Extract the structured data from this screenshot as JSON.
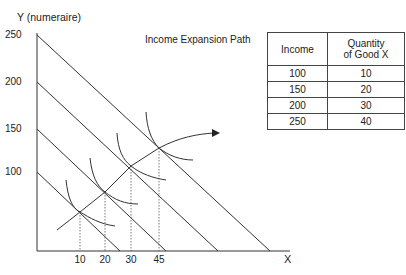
{
  "diagram": {
    "title": "Income Expansion Path",
    "y_axis_label": "Y (numeraire)",
    "x_axis_label": "X",
    "y_ticks": [
      "250",
      "200",
      "150",
      "100"
    ],
    "x_ticks": [
      "10",
      "20",
      "30",
      "45"
    ],
    "budget_lines": [
      {
        "income": 100,
        "y_intercept": 100
      },
      {
        "income": 150,
        "y_intercept": 150
      },
      {
        "income": 200,
        "y_intercept": 200
      },
      {
        "income": 250,
        "y_intercept": 250
      }
    ],
    "tangency_points_x": [
      10,
      20,
      30,
      45
    ],
    "expansion_path_arrow": "arrow-right",
    "line_color": "#333333"
  },
  "table": {
    "headers": [
      "Income",
      "Quantity\nof Good X"
    ],
    "header_line1": "Quantity",
    "header_line2": "of Good X",
    "rows": [
      [
        "100",
        "10"
      ],
      [
        "150",
        "20"
      ],
      [
        "200",
        "30"
      ],
      [
        "250",
        "40"
      ]
    ]
  }
}
